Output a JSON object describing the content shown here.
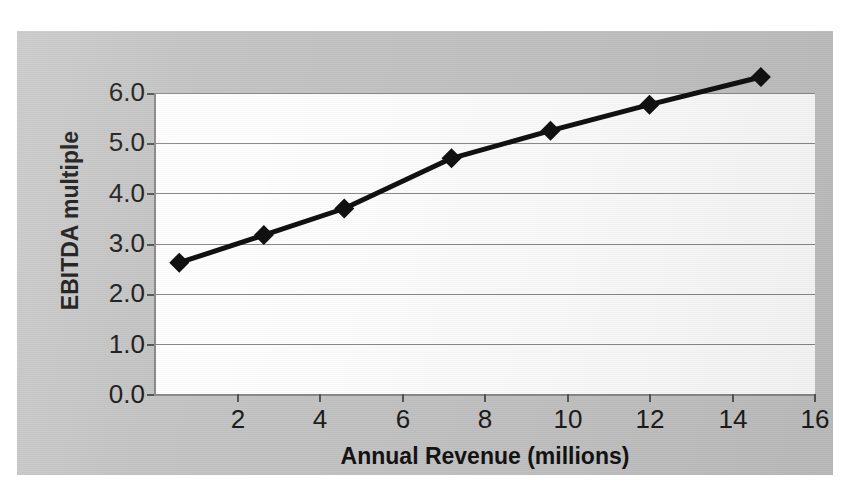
{
  "chart_data": {
    "type": "line",
    "title": "",
    "xlabel": "Annual Revenue (millions)",
    "ylabel": "EBITDA multiple",
    "xlim": [
      0,
      16
    ],
    "ylim": [
      0,
      6
    ],
    "grid": true,
    "legend": "none",
    "marker": "diamond",
    "x_ticks": [
      "2",
      "4",
      "6",
      "8",
      "10",
      "12",
      "14",
      "16"
    ],
    "x_tick_values": [
      2,
      4,
      6,
      8,
      10,
      12,
      14,
      16
    ],
    "y_ticks": [
      "0.0",
      "1.0",
      "2.0",
      "3.0",
      "4.0",
      "5.0",
      "6.0"
    ],
    "y_tick_values": [
      0,
      1,
      2,
      3,
      4,
      5,
      6
    ],
    "series": [
      {
        "name": "EBITDA multiple",
        "color": "#111111",
        "x": [
          1.0,
          3.05,
          5.0,
          7.6,
          10.0,
          12.4,
          15.1
        ],
        "y": [
          2.0,
          2.55,
          3.08,
          4.08,
          4.63,
          5.15,
          5.7
        ]
      }
    ]
  },
  "colors": {
    "backdrop": "#c4c4c4",
    "plot_background": "#ffffff",
    "gridline": "#8a8a8a",
    "series_line": "#111111",
    "text": "#1a1a1a"
  }
}
